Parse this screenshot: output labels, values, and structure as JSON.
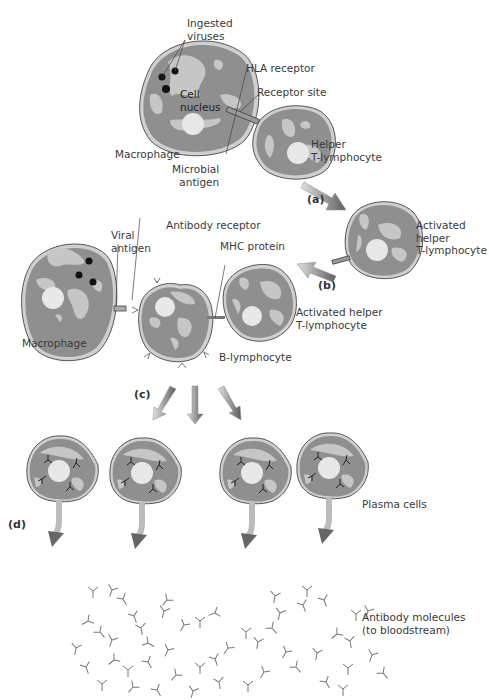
{
  "colors": {
    "cell_fill": "#8f8f8f",
    "cell_edge": "#555555",
    "cell_rim": "#c9c9c9",
    "organelle": "#c4c4c4",
    "nucleus": "#e6e6e6",
    "virus": "#111111",
    "arrow_light": "#d8d8d8",
    "arrow_dark": "#666666",
    "antibody": "#777777",
    "leader": "#444444"
  },
  "labels": {
    "ingested_viruses": "Ingested\nviruses",
    "cell_nucleus": "Cell\nnucleus",
    "hla_receptor": "HLA receptor",
    "receptor_site": "Receptor site",
    "macrophage_top": "Macrophage",
    "microbial_antigen": "Microbial\nantigen",
    "helper_t": "Helper\nT-lymphocyte",
    "activated_helper_1": "Activated\nhelper\nT-lymphocyte",
    "antibody_receptor": "Antibody receptor",
    "viral_antigen": "Viral\nantigen",
    "mhc_protein": "MHC protein",
    "activated_helper_2": "Activated helper\nT-lymphocyte",
    "macrophage_mid": "Macrophage",
    "b_lymphocyte": "B-lymphocyte",
    "plasma_cells": "Plasma cells",
    "antibody_molecules": "Antibody molecules\n(to bloodstream)"
  },
  "steps": {
    "a": "(a)",
    "b": "(b)",
    "c": "(c)",
    "d": "(d)"
  },
  "cells": [
    {
      "id": "macrophage-top",
      "cx": 200,
      "cy": 95,
      "rx": 58,
      "ry": 58,
      "viruses": [
        [
          160,
          77
        ],
        [
          174,
          70
        ],
        [
          165,
          90
        ]
      ]
    },
    {
      "id": "helper-t",
      "cx": 295,
      "cy": 140,
      "rx": 42,
      "ry": 40,
      "viruses": []
    },
    {
      "id": "activated-helper-1",
      "cx": 386,
      "cy": 240,
      "rx": 40,
      "ry": 38,
      "viruses": []
    },
    {
      "id": "macrophage-mid",
      "cx": 63,
      "cy": 303,
      "rx": 58,
      "ry": 62,
      "viruses": [
        [
          88,
          262
        ],
        [
          78,
          275
        ],
        [
          92,
          282
        ]
      ]
    },
    {
      "id": "b-lymphocyte",
      "cx": 174,
      "cy": 322,
      "rx": 38,
      "ry": 40,
      "viruses": []
    },
    {
      "id": "activated-helper-2",
      "cx": 258,
      "cy": 300,
      "rx": 36,
      "ry": 40,
      "viruses": []
    }
  ],
  "plasma_cells": [
    {
      "cx": 62,
      "cy": 473
    },
    {
      "cx": 145,
      "cy": 475
    },
    {
      "cx": 255,
      "cy": 475
    },
    {
      "cx": 332,
      "cy": 470
    }
  ],
  "antibodies": [
    [
      93,
      591,
      0
    ],
    [
      112,
      590,
      20
    ],
    [
      123,
      599,
      -30
    ],
    [
      167,
      600,
      40
    ],
    [
      134,
      616,
      -20
    ],
    [
      164,
      611,
      15
    ],
    [
      88,
      621,
      60
    ],
    [
      100,
      632,
      -40
    ],
    [
      141,
      628,
      -10
    ],
    [
      184,
      625,
      30
    ],
    [
      200,
      621,
      0
    ],
    [
      215,
      613,
      70
    ],
    [
      112,
      640,
      20
    ],
    [
      148,
      643,
      -60
    ],
    [
      76,
      648,
      10
    ],
    [
      86,
      667,
      -20
    ],
    [
      114,
      660,
      50
    ],
    [
      128,
      670,
      0
    ],
    [
      148,
      662,
      -30
    ],
    [
      168,
      650,
      25
    ],
    [
      176,
      675,
      40
    ],
    [
      200,
      667,
      0
    ],
    [
      215,
      659,
      -20
    ],
    [
      228,
      648,
      35
    ],
    [
      246,
      632,
      0
    ],
    [
      258,
      642,
      10
    ],
    [
      272,
      628,
      -40
    ],
    [
      280,
      613,
      15
    ],
    [
      303,
      605,
      -20
    ],
    [
      286,
      652,
      30
    ],
    [
      296,
      667,
      -40
    ],
    [
      317,
      653,
      10
    ],
    [
      337,
      634,
      50
    ],
    [
      350,
      641,
      -10
    ],
    [
      356,
      614,
      0
    ],
    [
      368,
      611,
      20
    ],
    [
      326,
      682,
      -30
    ],
    [
      248,
      685,
      0
    ],
    [
      193,
      691,
      15
    ],
    [
      219,
      682,
      -10
    ],
    [
      264,
      672,
      30
    ],
    [
      348,
      668,
      0
    ],
    [
      324,
      600,
      -20
    ],
    [
      275,
      596,
      10
    ],
    [
      307,
      590,
      0
    ],
    [
      372,
      655,
      20
    ],
    [
      383,
      673,
      -40
    ],
    [
      343,
      689,
      0
    ],
    [
      102,
      684,
      0
    ],
    [
      133,
      687,
      40
    ],
    [
      157,
      690,
      -30
    ]
  ],
  "arrows": [
    {
      "id": "arrow-a",
      "x1": 305,
      "y1": 185,
      "x2": 340,
      "y2": 205
    },
    {
      "id": "arrow-b",
      "x1": 333,
      "y1": 265,
      "x2": 300,
      "y2": 278
    },
    {
      "id": "arrow-c1",
      "x1": 174,
      "y1": 387,
      "x2": 153,
      "y2": 418
    },
    {
      "id": "arrow-c2",
      "x1": 195,
      "y1": 387,
      "x2": 195,
      "y2": 422
    },
    {
      "id": "arrow-c3",
      "x1": 220,
      "y1": 387,
      "x2": 240,
      "y2": 418
    }
  ]
}
